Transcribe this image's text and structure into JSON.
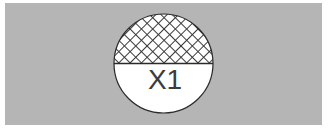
{
  "figure": {
    "title": "",
    "background_color": "#b5b5b5",
    "canvas_color": "#ffffff",
    "panel": {
      "x": 5,
      "y": 3,
      "width": 317,
      "height": 122,
      "fill": "#b5b5b5"
    },
    "circle": {
      "center_x": 163.5,
      "center_y": 63.5,
      "radius": 49.5,
      "stroke": "#2b2b2b",
      "stroke_width": 1.2,
      "fill": "#ffffff"
    },
    "upper_half": {
      "name": "crosshatched-upper-half",
      "pattern": "cross-hatch",
      "pattern_spacing": 8,
      "pattern_line_color": "#3a3a3a",
      "pattern_line_width": 2,
      "pattern_background": "#ffffff"
    },
    "lower_half": {
      "name": "plain-lower-half",
      "fill": "#ffffff",
      "label": "X1"
    },
    "divider": {
      "name": "horizontal-divider",
      "y": 63.5,
      "stroke": "#2b2b2b",
      "stroke_width": 1.2
    },
    "label": {
      "text": "X1",
      "color": "#3c3c3c",
      "font_size": 26,
      "x": 165,
      "y": 88
    }
  }
}
